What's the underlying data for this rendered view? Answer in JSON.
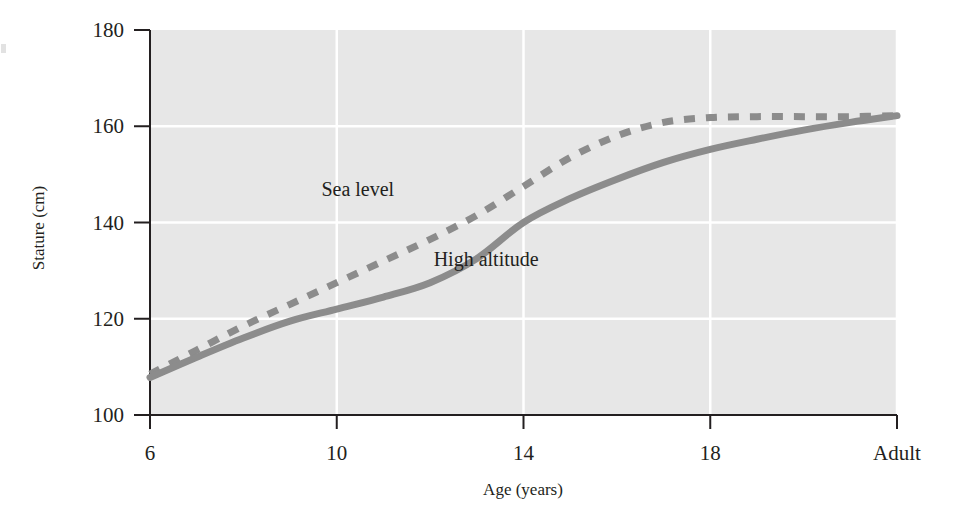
{
  "chart_data": {
    "type": "line",
    "title": "",
    "subtitle": "",
    "xlabel": "Age (years)",
    "ylabel": "Stature (cm)",
    "xticks": [
      "6",
      "10",
      "14",
      "18",
      "Adult"
    ],
    "xtick_values": [
      6,
      10,
      14,
      18,
      22
    ],
    "yticks": [
      "100",
      "120",
      "140",
      "160",
      "180"
    ],
    "ytick_values": [
      100,
      120,
      140,
      160,
      180
    ],
    "xlim": [
      6,
      22
    ],
    "ylim": [
      100,
      180
    ],
    "grid": true,
    "grid_color": "#ffffff",
    "plot_background": "#e7e7e7",
    "legend_position": "inline-annotations",
    "series": [
      {
        "name": "Sea level",
        "style": "dashed",
        "color": "#8c8c8c",
        "label_x": 10.45,
        "label_y": 145.5,
        "x": [
          6,
          7,
          8,
          9,
          10,
          11,
          12,
          13,
          14,
          15,
          16,
          17,
          18,
          19,
          20,
          21,
          22
        ],
        "y": [
          108.5,
          113.5,
          118.5,
          123.0,
          127.5,
          132.0,
          136.5,
          141.5,
          147.5,
          153.5,
          158.0,
          160.8,
          161.8,
          162.0,
          162.0,
          162.0,
          162.2
        ]
      },
      {
        "name": "High altitude",
        "style": "solid",
        "color": "#8c8c8c",
        "label_x": 13.2,
        "label_y": 131.0,
        "x": [
          6,
          7,
          8,
          9,
          10,
          11,
          12,
          13,
          14,
          15,
          16,
          17,
          18,
          19,
          20,
          21,
          22
        ],
        "y": [
          107.8,
          112.0,
          116.0,
          119.5,
          122.0,
          124.5,
          127.5,
          132.5,
          140.0,
          145.0,
          149.0,
          152.5,
          155.2,
          157.3,
          159.2,
          160.8,
          162.2
        ]
      }
    ],
    "annotations": [
      {
        "text": "Sea level",
        "x": 10.45,
        "y": 145.5
      },
      {
        "text": "High altitude",
        "x": 13.2,
        "y": 131.0
      }
    ]
  }
}
